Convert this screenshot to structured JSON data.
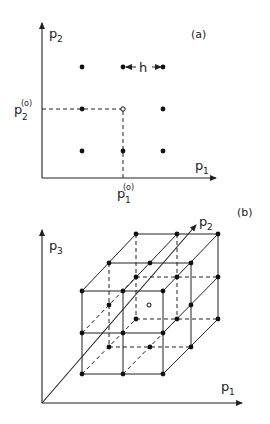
{
  "panel_a": {
    "label": "(a)",
    "axis_x": {
      "name": "p",
      "sub": "1"
    },
    "axis_y": {
      "name": "p",
      "sub": "2"
    },
    "x0_label": {
      "name": "p",
      "sub": "1",
      "sup": "(o)"
    },
    "y0_label": {
      "name": "p",
      "sub": "2",
      "sup": "(o)"
    },
    "step_label": "h",
    "center_point": {
      "x": 123,
      "y": 109,
      "style": "open"
    },
    "points": [
      [
        82,
        67
      ],
      [
        123,
        67
      ],
      [
        163,
        67
      ],
      [
        82,
        109
      ],
      [
        163,
        109
      ],
      [
        82,
        151
      ],
      [
        123,
        151
      ],
      [
        163,
        151
      ]
    ]
  },
  "panel_b": {
    "label": "(b)",
    "axis_x": {
      "name": "p",
      "sub": "1"
    },
    "axis_y": {
      "name": "p",
      "sub": "2"
    },
    "axis_z": {
      "name": "p",
      "sub": "3"
    },
    "center_point": {
      "x": 149,
      "y": 305,
      "style": "open"
    },
    "layers": {
      "front": {
        "cols": [
          82,
          123,
          163
        ],
        "rows": [
          291,
          333,
          374
        ]
      },
      "middle": {
        "cols": [
          109,
          150,
          191
        ],
        "rows": [
          263,
          305,
          347
        ]
      },
      "back": {
        "cols": [
          136,
          177,
          218
        ],
        "rows": [
          234,
          277,
          319
        ]
      }
    }
  }
}
